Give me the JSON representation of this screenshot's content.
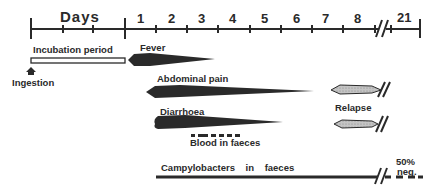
{
  "axis": {
    "label": "Days",
    "ticks": [
      "1",
      "2",
      "3",
      "4",
      "5",
      "6",
      "7",
      "8",
      "21"
    ],
    "break_symbol": "//"
  },
  "rows": {
    "incubation": {
      "label": "Incubation period"
    },
    "ingestion": {
      "label": "Ingestion"
    },
    "fever": {
      "label": "Fever"
    },
    "abdominal_pain": {
      "label": "Abdominal pain"
    },
    "diarrhoea": {
      "label": "Diarrhoea"
    },
    "blood": {
      "label": "Blood in faeces"
    },
    "relapse": {
      "label": "Relapse"
    },
    "campylobacters": {
      "label": "Campylobacters in faeces",
      "end_note_line1": "50%",
      "end_note_line2": "neg."
    }
  },
  "colors": {
    "ink": "#2a2a2a",
    "relapse_fill": "#b8b8b8",
    "background": "#ffffff"
  }
}
